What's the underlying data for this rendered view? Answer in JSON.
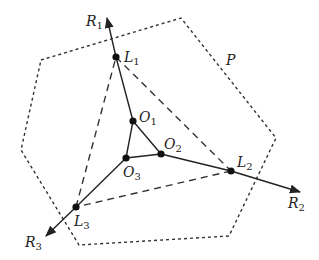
{
  "diagram": {
    "colors": {
      "stroke": "#222222",
      "background": "#ffffff"
    },
    "polygon": {
      "label": "P",
      "style": "dotted",
      "vertices": [
        [
          41,
          60
        ],
        [
          181,
          18
        ],
        [
          276,
          138
        ],
        [
          229,
          236
        ],
        [
          79,
          245
        ],
        [
          21,
          150
        ]
      ]
    },
    "points": {
      "L1": [
        116,
        57
      ],
      "L2": [
        231,
        171
      ],
      "L3": [
        76,
        207
      ],
      "O1": [
        133,
        121
      ],
      "O2": [
        161,
        154
      ],
      "O3": [
        126,
        158
      ]
    },
    "rays": [
      {
        "name": "R1",
        "from": "L1",
        "tip": [
          107,
          18
        ]
      },
      {
        "name": "R2",
        "from": "L2",
        "tip": [
          300,
          192
        ]
      },
      {
        "name": "R3",
        "from": "L3",
        "tip": [
          46,
          236
        ]
      }
    ],
    "solid_edges": [
      [
        "L1",
        "O1"
      ],
      [
        "O1",
        "O2"
      ],
      [
        "O2",
        "O3"
      ],
      [
        "O3",
        "O1"
      ],
      [
        "O2",
        "L2"
      ],
      [
        "O3",
        "L3"
      ]
    ],
    "dashed_edges": [
      [
        "L1",
        "L2"
      ],
      [
        "L2",
        "L3"
      ],
      [
        "L3",
        "L1"
      ]
    ],
    "labels": {
      "R1": {
        "base": "R",
        "sub": "1"
      },
      "R2": {
        "base": "R",
        "sub": "2"
      },
      "R3": {
        "base": "R",
        "sub": "3"
      },
      "L1": {
        "base": "L",
        "sub": "1"
      },
      "L2": {
        "base": "L",
        "sub": "2"
      },
      "L3": {
        "base": "L",
        "sub": "3"
      },
      "O1": {
        "base": "O",
        "sub": "1"
      },
      "O2": {
        "base": "O",
        "sub": "2"
      },
      "O3": {
        "base": "O",
        "sub": "3"
      },
      "P": {
        "base": "P"
      }
    }
  }
}
